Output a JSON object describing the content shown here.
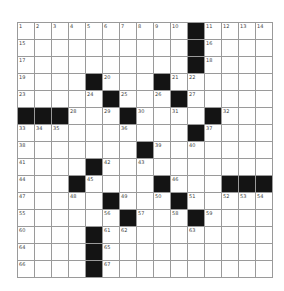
{
  "puzzle": {
    "rows": 15,
    "cols": 15,
    "colors": {
      "block": "#141414",
      "cell": "#ffffff",
      "line": "#9a9a9a",
      "number": "#444444"
    },
    "layout": [
      "..........#....",
      "..........#....",
      "..........#....",
      "....#...#......",
      ".....#...#.....",
      "###...#....#...",
      "..........#....",
      ".......#.......",
      "....#..........",
      "...#....#...###",
      ".....#...#.....",
      "......#...#....",
      "....#..........",
      "....#..........",
      "....#.........."
    ],
    "numbers": [
      {
        "r": 0,
        "c": 0,
        "n": "1"
      },
      {
        "r": 0,
        "c": 1,
        "n": "2"
      },
      {
        "r": 0,
        "c": 2,
        "n": "3"
      },
      {
        "r": 0,
        "c": 3,
        "n": "4"
      },
      {
        "r": 0,
        "c": 4,
        "n": "5"
      },
      {
        "r": 0,
        "c": 5,
        "n": "6"
      },
      {
        "r": 0,
        "c": 6,
        "n": "7"
      },
      {
        "r": 0,
        "c": 7,
        "n": "8"
      },
      {
        "r": 0,
        "c": 8,
        "n": "9"
      },
      {
        "r": 0,
        "c": 9,
        "n": "10"
      },
      {
        "r": 0,
        "c": 11,
        "n": "11"
      },
      {
        "r": 0,
        "c": 12,
        "n": "12"
      },
      {
        "r": 0,
        "c": 13,
        "n": "13"
      },
      {
        "r": 0,
        "c": 14,
        "n": "14"
      },
      {
        "r": 1,
        "c": 0,
        "n": "15"
      },
      {
        "r": 1,
        "c": 11,
        "n": "16"
      },
      {
        "r": 2,
        "c": 0,
        "n": "17"
      },
      {
        "r": 2,
        "c": 11,
        "n": "18"
      },
      {
        "r": 3,
        "c": 0,
        "n": "19"
      },
      {
        "r": 3,
        "c": 5,
        "n": "20"
      },
      {
        "r": 3,
        "c": 9,
        "n": "21"
      },
      {
        "r": 3,
        "c": 10,
        "n": "22"
      },
      {
        "r": 4,
        "c": 0,
        "n": "23"
      },
      {
        "r": 4,
        "c": 4,
        "n": "24"
      },
      {
        "r": 4,
        "c": 6,
        "n": "25"
      },
      {
        "r": 4,
        "c": 8,
        "n": "26"
      },
      {
        "r": 4,
        "c": 10,
        "n": "27"
      },
      {
        "r": 5,
        "c": 3,
        "n": "28"
      },
      {
        "r": 5,
        "c": 5,
        "n": "29"
      },
      {
        "r": 5,
        "c": 7,
        "n": "30"
      },
      {
        "r": 5,
        "c": 9,
        "n": "31"
      },
      {
        "r": 5,
        "c": 12,
        "n": "32"
      },
      {
        "r": 6,
        "c": 0,
        "n": "33"
      },
      {
        "r": 6,
        "c": 1,
        "n": "34"
      },
      {
        "r": 6,
        "c": 2,
        "n": "35"
      },
      {
        "r": 6,
        "c": 6,
        "n": "36"
      },
      {
        "r": 6,
        "c": 11,
        "n": "37"
      },
      {
        "r": 7,
        "c": 0,
        "n": "38"
      },
      {
        "r": 7,
        "c": 8,
        "n": "39"
      },
      {
        "r": 7,
        "c": 10,
        "n": "40"
      },
      {
        "r": 8,
        "c": 0,
        "n": "41"
      },
      {
        "r": 8,
        "c": 5,
        "n": "42"
      },
      {
        "r": 8,
        "c": 7,
        "n": "43"
      },
      {
        "r": 9,
        "c": 0,
        "n": "44"
      },
      {
        "r": 9,
        "c": 4,
        "n": "45"
      },
      {
        "r": 9,
        "c": 9,
        "n": "46"
      },
      {
        "r": 10,
        "c": 0,
        "n": "47"
      },
      {
        "r": 10,
        "c": 3,
        "n": "48"
      },
      {
        "r": 10,
        "c": 6,
        "n": "49"
      },
      {
        "r": 10,
        "c": 8,
        "n": "50"
      },
      {
        "r": 10,
        "c": 10,
        "n": "51"
      },
      {
        "r": 10,
        "c": 12,
        "n": "52"
      },
      {
        "r": 10,
        "c": 13,
        "n": "53"
      },
      {
        "r": 10,
        "c": 14,
        "n": "54"
      },
      {
        "r": 11,
        "c": 0,
        "n": "55"
      },
      {
        "r": 11,
        "c": 5,
        "n": "56"
      },
      {
        "r": 11,
        "c": 7,
        "n": "57"
      },
      {
        "r": 11,
        "c": 9,
        "n": "58"
      },
      {
        "r": 11,
        "c": 11,
        "n": "59"
      },
      {
        "r": 12,
        "c": 0,
        "n": "60"
      },
      {
        "r": 12,
        "c": 5,
        "n": "61"
      },
      {
        "r": 12,
        "c": 6,
        "n": "62"
      },
      {
        "r": 12,
        "c": 10,
        "n": "63"
      },
      {
        "r": 13,
        "c": 0,
        "n": "64"
      },
      {
        "r": 13,
        "c": 5,
        "n": "65"
      },
      {
        "r": 14,
        "c": 0,
        "n": "66"
      },
      {
        "r": 14,
        "c": 5,
        "n": "67"
      }
    ]
  }
}
